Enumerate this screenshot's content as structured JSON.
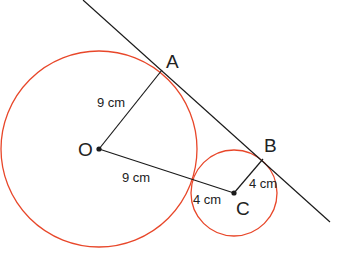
{
  "diagram": {
    "type": "two circles with common tangent",
    "colors": {
      "circle": "#e8472a",
      "line": "#1a1a1a",
      "text": "#222222"
    },
    "points": {
      "O": {
        "label": "O",
        "x": 99,
        "y": 149
      },
      "A": {
        "label": "A",
        "x": 162,
        "y": 70
      },
      "B": {
        "label": "B",
        "x": 263,
        "y": 159
      },
      "C": {
        "label": "C",
        "x": 234,
        "y": 193
      }
    },
    "circles": [
      {
        "center": "O",
        "radius_px": 98
      },
      {
        "center": "C",
        "radius_px": 43
      }
    ],
    "segments": [
      {
        "from": "O",
        "to": "A",
        "length_label": "9 cm"
      },
      {
        "from": "O",
        "to": "C",
        "length_label": "9 cm"
      },
      {
        "from": "C",
        "to": "B",
        "length_label": "4 cm"
      }
    ],
    "extra_labels": [
      {
        "text": "4 cm",
        "near": "C",
        "meaning": "radius of small circle"
      }
    ],
    "tangent_line": {
      "x1": 83,
      "y1": 0,
      "x2": 330,
      "y2": 222
    },
    "labels": {
      "O": "O",
      "A": "A",
      "B": "B",
      "C": "C",
      "OA": "9 cm",
      "OC": "9 cm",
      "CB": "4 cm",
      "C_radius": "4 cm"
    }
  }
}
